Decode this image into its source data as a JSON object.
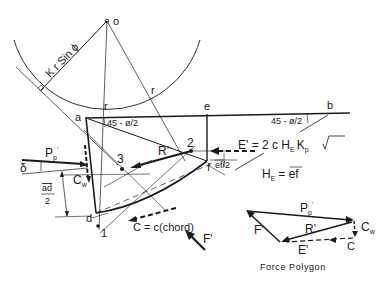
{
  "figure": {
    "points": {
      "o": "o",
      "a": "a",
      "b": "b",
      "d": "d",
      "e": "e",
      "f": "f",
      "p1": "1",
      "p2": "2",
      "p3": "3"
    },
    "labels": {
      "radius_r_left": "r",
      "radius_r_right": "r",
      "lever_arm": "K r Sin ϕ",
      "angle_a": "45 - ø/2",
      "angle_b": "45 - ø/2",
      "delta": "δ",
      "pp_main": "P",
      "pp_sub": "p",
      "pp_prime": "'",
      "cw_main": "C",
      "cw_sub": "w",
      "ad_half_num": "ad",
      "ad_half_den": "2",
      "r_prime": "R'",
      "ef_half": "ef/2",
      "e_prime_formula_a": "E' = 2 c H",
      "e_prime_formula_sub": "E",
      "e_prime_formula_b": "K",
      "e_prime_formula_sub2": "p",
      "he_main": "H",
      "he_sub": "E",
      "he_eq": "= ef",
      "cohesion_chord": "C = c(chord)",
      "f_prime": "F'"
    },
    "force_polygon": {
      "title": "Force Polygon",
      "pp_main": "P",
      "pp_sub": "p",
      "pp_prime": "'",
      "cw_main": "C",
      "cw_sub": "w",
      "r_prime": "R'",
      "f_prime": "F'",
      "e_prime": "E'",
      "c": "C"
    }
  }
}
